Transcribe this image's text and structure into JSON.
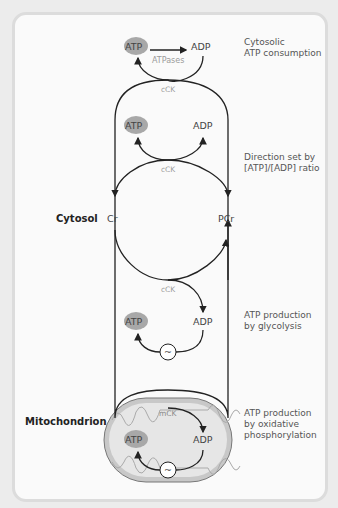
{
  "regions": {
    "cytosol": "Cytosol",
    "mitochondrion": "Mitochondrion"
  },
  "side_notes": {
    "consumption_line1": "Cytosolic",
    "consumption_line2": "ATP consumption",
    "direction_line1": "Direction set by",
    "direction_line2": "[ATP]/[ADP] ratio",
    "glycolysis_line1": "ATP production",
    "glycolysis_line2": "by glycolysis",
    "oxphos_line1": "ATP production",
    "oxphos_line2": "by oxidative",
    "oxphos_line3": "phosphorylation"
  },
  "nodes": {
    "atp": "ATP",
    "adp": "ADP",
    "cr": "Cr",
    "pcr": "PCr",
    "tilde": "~"
  },
  "enzymes": {
    "atpases": "ATPases",
    "cck": "cCK",
    "mck": "mCK"
  },
  "colors": {
    "atp_fill": "#a8a8a8",
    "mito_fill": "#c8c8c8",
    "mito_inner": "#e6e6e6",
    "line": "#222222",
    "enzyme_text": "#9a9a9a"
  }
}
